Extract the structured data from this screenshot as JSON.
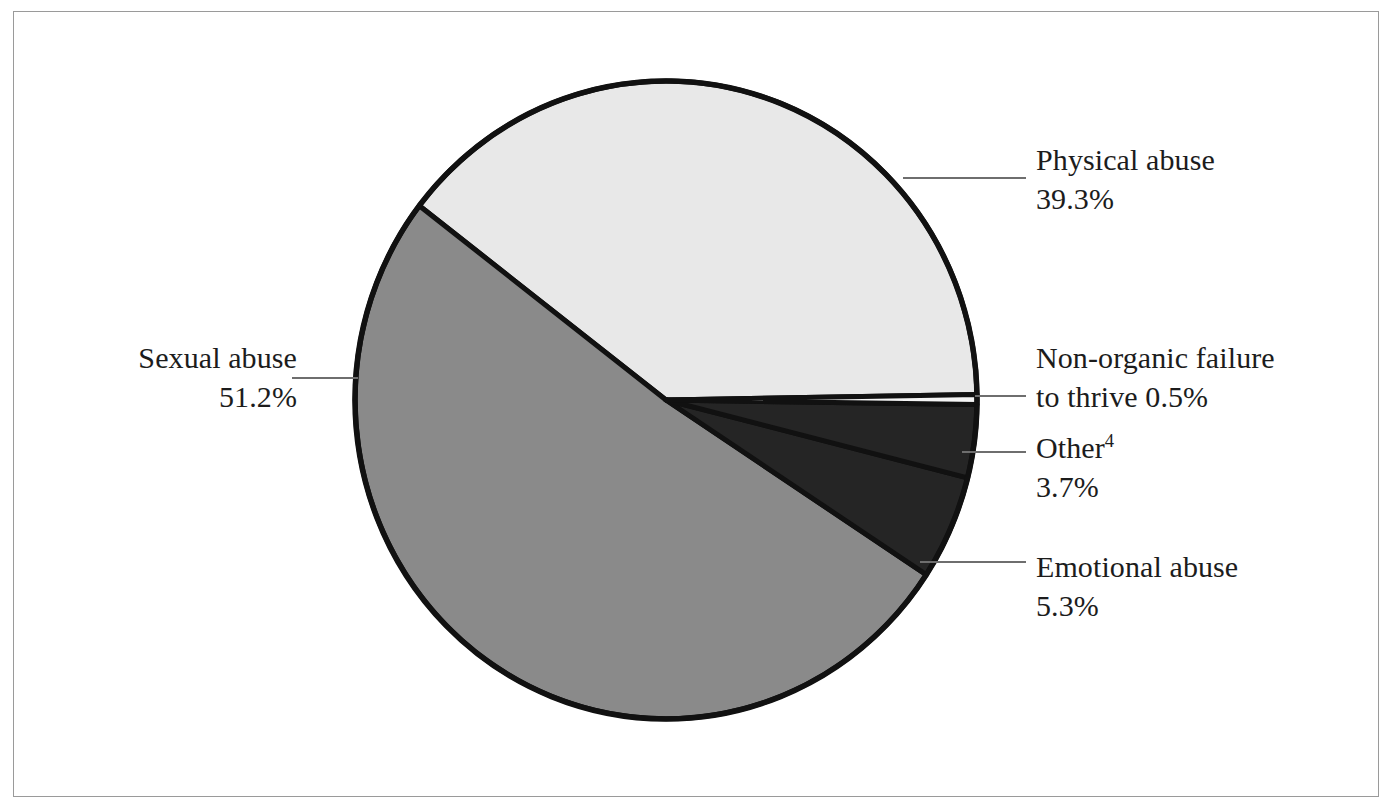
{
  "figure": {
    "background_color": "#ffffff",
    "frame_color": "#9a9a9a",
    "outline_color": "#111111",
    "leader_color": "#6e6e6e"
  },
  "chart_data": {
    "type": "pie",
    "title": "",
    "subtitle": "",
    "xlabel": "",
    "ylabel": "",
    "legend_position": "callout-labels",
    "grid": false,
    "units": "percent",
    "total": 100.0,
    "start_angle_deg": -1.0,
    "direction": "clockwise",
    "categories": [
      "Non-organic failure to thrive",
      "Other",
      "Emotional abuse",
      "Sexual abuse",
      "Physical abuse"
    ],
    "values": [
      0.5,
      3.7,
      5.3,
      51.2,
      39.3
    ],
    "colors": [
      "#f2f2f2",
      "#252525",
      "#252525",
      "#8a8a8a",
      "#e8e8e8"
    ],
    "slices": [
      {
        "name": "Non-organic failure to thrive",
        "label": "Non-organic failure",
        "label_line2": "to thrive 0.5%",
        "value": 0.5,
        "value_text": "0.5%",
        "color": "#f4f4f4",
        "start_deg": -1.0,
        "end_deg": 0.8
      },
      {
        "name": "Other",
        "label": "Other",
        "superscript": "4",
        "value": 3.7,
        "value_text": "3.7%",
        "color": "#252525",
        "start_deg": 0.8,
        "end_deg": 14.12
      },
      {
        "name": "Emotional abuse",
        "label": "Emotional abuse",
        "value": 5.3,
        "value_text": "5.3%",
        "color": "#252525",
        "start_deg": 14.12,
        "end_deg": 33.2
      },
      {
        "name": "Sexual abuse",
        "label": "Sexual abuse",
        "value": 51.2,
        "value_text": "51.2%",
        "color": "#8a8a8a",
        "start_deg": 33.2,
        "end_deg": 217.52
      },
      {
        "name": "Physical abuse",
        "label": "Physical abuse",
        "value": 39.3,
        "value_text": "39.3%",
        "color": "#e8e8e8",
        "start_deg": 217.52,
        "end_deg": 359.0
      }
    ]
  },
  "geometry": {
    "cx": 666,
    "cy": 400,
    "rx": 311,
    "ry": 319
  },
  "labels": {
    "physical": {
      "name": "Physical abuse",
      "percent": "39.3%"
    },
    "non_organic": {
      "line1": "Non-organic failure",
      "line2": "to thrive 0.5%"
    },
    "other": {
      "name": "Other",
      "superscript": "4",
      "percent": "3.7%"
    },
    "emotional": {
      "name": "Emotional abuse",
      "percent": "5.3%"
    },
    "sexual": {
      "name": "Sexual abuse",
      "percent": "51.2%"
    }
  }
}
